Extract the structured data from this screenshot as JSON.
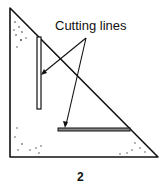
{
  "diagram": {
    "label": "Cutting lines",
    "caption": "2",
    "colors": {
      "stroke": "#111111",
      "background": "#ffffff"
    }
  }
}
